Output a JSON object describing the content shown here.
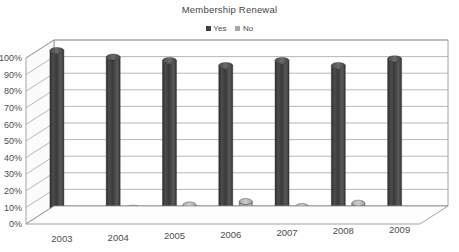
{
  "chart_data": {
    "type": "bar",
    "title": "Membership Renewal",
    "subtitle": "",
    "xlabel": "",
    "ylabel": "",
    "categories": [
      "2003",
      "2004",
      "2005",
      "2006",
      "2007",
      "2008",
      "2009"
    ],
    "series": [
      {
        "name": "Yes",
        "color": "#3f3f3f",
        "values": [
          100,
          96,
          94,
          91,
          94,
          91,
          95
        ]
      },
      {
        "name": "No",
        "color": "#a8a8a8",
        "values": [
          3,
          5,
          7,
          9,
          6,
          8,
          4
        ]
      }
    ],
    "ylim": [
      0,
      100
    ],
    "ytick_labels": [
      "100%",
      "90%",
      "80%",
      "70%",
      "60%",
      "50%",
      "40%",
      "30%",
      "20%",
      "10%",
      "0%"
    ],
    "ytick_values": [
      100,
      90,
      80,
      70,
      60,
      50,
      40,
      30,
      20,
      10,
      0
    ],
    "grid": true,
    "legend_position": "top-center",
    "style": "3d-cylinder"
  },
  "legend": {
    "entries": [
      {
        "label": "Yes",
        "swatch_color": "#3f3f3f"
      },
      {
        "label": "No",
        "swatch_color": "#a8a8a8"
      }
    ]
  },
  "colors": {
    "series_yes": "#3f3f3f",
    "series_no": "#a8a8a8",
    "gridline": "#9a9a9a",
    "text": "#4a4a4a",
    "background": "#ffffff"
  }
}
